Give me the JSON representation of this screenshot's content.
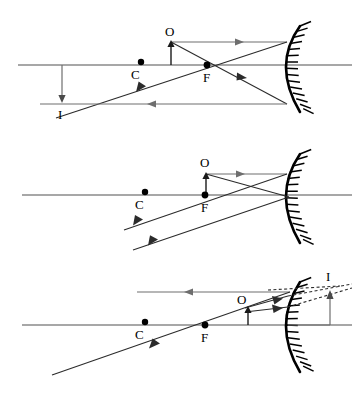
{
  "figure": {
    "panel_count": 3
  },
  "labels": {
    "object": "O",
    "centre_of_curvature": "C",
    "focus": "F",
    "image": "I"
  },
  "colors": {
    "ray": "#2b2b2b",
    "axis": "#8a8a8a",
    "mirror": "#000000",
    "background": "#ffffff"
  },
  "panels": [
    {
      "id": "panel-1",
      "case": "object beyond C",
      "axis_y": 65,
      "mirror_vertex_x": 288,
      "points": {
        "C": {
          "x": 141,
          "y": 65,
          "label": "C"
        },
        "F": {
          "x": 207,
          "y": 65,
          "label": "F"
        },
        "O": {
          "x": 170,
          "y": 33,
          "label": "O"
        },
        "I": {
          "x": 62,
          "y": 108,
          "label": "I"
        }
      },
      "object": {
        "base_x": 170,
        "base_y": 65,
        "tip_y": 42,
        "orientation": "upright"
      },
      "image": {
        "base_x": 62,
        "base_y": 65,
        "tip_y": 100,
        "orientation": "inverted",
        "type": "real"
      }
    },
    {
      "id": "panel-2",
      "case": "object at F",
      "axis_y": 55,
      "mirror_vertex_x": 288,
      "points": {
        "C": {
          "x": 145,
          "y": 55,
          "label": "C"
        },
        "F": {
          "x": 205,
          "y": 55,
          "label": "F"
        },
        "O": {
          "x": 205,
          "y": 25,
          "label": "O"
        }
      },
      "object": {
        "base_x": 205,
        "base_y": 55,
        "tip_y": 34,
        "orientation": "upright"
      },
      "image": {
        "type": "none",
        "note": "reflected rays emerge parallel"
      }
    },
    {
      "id": "panel-3",
      "case": "object between F and mirror",
      "axis_y": 63,
      "mirror_vertex_x": 288,
      "points": {
        "C": {
          "x": 145,
          "y": 63,
          "label": "C"
        },
        "F": {
          "x": 205,
          "y": 63,
          "label": "F"
        },
        "O": {
          "x": 243,
          "y": 37,
          "label": "O"
        },
        "I": {
          "x": 330,
          "y": 22,
          "label": "I"
        }
      },
      "object": {
        "base_x": 248,
        "base_y": 63,
        "tip_y": 46,
        "orientation": "upright"
      },
      "image": {
        "base_x": 330,
        "base_y": 63,
        "tip_y": 35,
        "orientation": "upright",
        "type": "virtual"
      }
    }
  ]
}
